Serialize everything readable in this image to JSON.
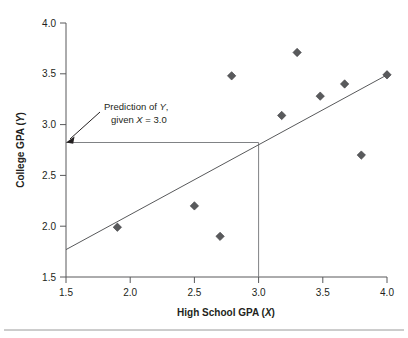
{
  "chart_data": {
    "type": "scatter",
    "title": "",
    "xlabel": "High School GPA (X)",
    "xlabel_main": "High School GPA (",
    "xlabel_var": "X",
    "xlabel_close": ")",
    "ylabel": "College GPA (Y)",
    "ylabel_main": "College GPA (",
    "ylabel_var": "Y",
    "ylabel_close": ")",
    "xlim": [
      1.5,
      4.0
    ],
    "ylim": [
      1.5,
      4.0
    ],
    "xticks": [
      "1.5",
      "2.0",
      "2.5",
      "3.0",
      "3.5",
      "4.0"
    ],
    "yticks": [
      "1.5",
      "2.0",
      "2.5",
      "3.0",
      "3.5",
      "4.0"
    ],
    "grid": false,
    "legend": null,
    "x": [
      1.9,
      2.5,
      2.7,
      2.79,
      3.18,
      3.3,
      3.48,
      3.67,
      3.8,
      4.0
    ],
    "y": [
      1.99,
      2.2,
      1.9,
      3.48,
      3.09,
      3.71,
      3.28,
      3.4,
      2.7,
      3.49
    ],
    "points": [
      {
        "x": 1.9,
        "y": 1.99
      },
      {
        "x": 2.5,
        "y": 2.2
      },
      {
        "x": 2.7,
        "y": 1.9
      },
      {
        "x": 2.79,
        "y": 3.48
      },
      {
        "x": 3.18,
        "y": 3.09
      },
      {
        "x": 3.3,
        "y": 3.71
      },
      {
        "x": 3.48,
        "y": 3.28
      },
      {
        "x": 3.67,
        "y": 3.4
      },
      {
        "x": 3.8,
        "y": 2.7
      },
      {
        "x": 4.0,
        "y": 3.49
      }
    ],
    "regression_line": {
      "x0": 1.5,
      "y0": 1.77,
      "x1": 4.0,
      "y1": 3.49
    },
    "prediction": {
      "x_value": 3.0,
      "y_value": 2.83,
      "annotation_line1_pre": "Prediction of ",
      "annotation_line1_var": "Y",
      "annotation_line1_post": ",",
      "annotation_line2_pre": "given ",
      "annotation_line2_var": "X",
      "annotation_line2_post": " = 3.0"
    },
    "colors": {
      "marker": "#595a5c",
      "axis": "#58595b",
      "regression": "#58595b",
      "prediction": "#808285",
      "text": "#231f20",
      "background": "#ffffff"
    }
  }
}
